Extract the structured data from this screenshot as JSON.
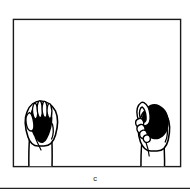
{
  "figure": {
    "panel_label": "c",
    "caption_position": "below-frame-center",
    "background_color": "#ffffff",
    "ink_color": "#000000",
    "frame": {
      "name": "panel-border",
      "style": "thin rectangular outline",
      "stroke_color": "#1a1a1a",
      "stroke_width_px": 1.4,
      "x": 13,
      "y": 19,
      "width": 168,
      "height": 148
    },
    "footer_rule": {
      "name": "footer-divider",
      "stroke_color": "#222222",
      "stroke_width_px": 1.2,
      "y": 188,
      "x_start": 0,
      "x_end": 190
    },
    "subjects": [
      {
        "id": "left-hand",
        "label": "Hand gripping spherical object, power grasp",
        "grasp_type": "power grip",
        "hand_side": "left",
        "fill": "#ffffff",
        "outline": "#000000",
        "finger_count_visible": 4,
        "object": {
          "id": "left-object",
          "label": "Dark spherical object",
          "shape": "sphere",
          "fill": "#000000"
        }
      },
      {
        "id": "right-hand",
        "label": "Hand gripping spherical object, side precision grasp",
        "grasp_type": "precision side grip",
        "hand_side": "right",
        "fill": "#ffffff",
        "outline": "#000000",
        "finger_count_visible": 4,
        "object": {
          "id": "right-object",
          "label": "Dark spherical object",
          "shape": "sphere",
          "fill": "#000000"
        }
      }
    ]
  }
}
